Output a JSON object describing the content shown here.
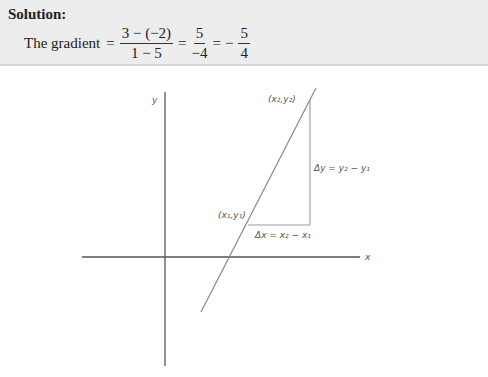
{
  "solution": {
    "title": "Solution:",
    "lead_text": "The gradient",
    "equals": "=",
    "fraction1": {
      "numerator": "3 − (−2)",
      "denominator": "1 − 5"
    },
    "fraction2": {
      "numerator": "5",
      "denominator": "−4"
    },
    "minus_sign": "−",
    "fraction3": {
      "numerator": "5",
      "denominator": "4"
    }
  },
  "diagram": {
    "axis_labels": {
      "x": "x",
      "y": "y"
    },
    "point1_label": "(x₁,y₁)",
    "point2_label": "(x₂,y₂)",
    "delta_x_label": "Δx = x₂ − x₁",
    "delta_y_label": "Δy = y₂ − y₁",
    "colors": {
      "axis": "#555555",
      "line": "#888888",
      "triangle": "#999999",
      "box_background": "#ededed"
    }
  }
}
